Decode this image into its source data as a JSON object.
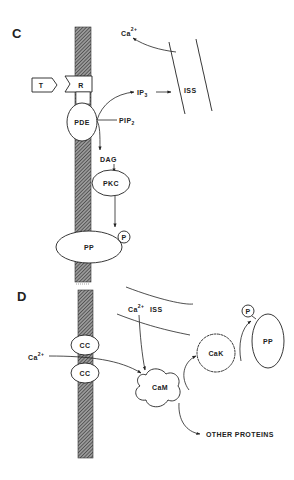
{
  "figure": {
    "panels": [
      {
        "id": "C",
        "label": "C",
        "nodes": {
          "T": "T",
          "R": "R",
          "PDE": "PDE",
          "PIP2": "PIP",
          "PIP2_sub": "2",
          "IP3": "IP",
          "IP3_sub": "3",
          "ISS": "ISS",
          "Ca": "Ca",
          "Ca_sup": "2+",
          "DAG": "DAG",
          "PKC": "PKC",
          "PP": "PP",
          "P": "P"
        },
        "edges": [
          {
            "from": "PIP2",
            "to": "IP3",
            "via": "PDE"
          },
          {
            "from": "PIP2",
            "to": "DAG",
            "via": "PDE"
          },
          {
            "from": "IP3",
            "to": "ISS"
          },
          {
            "from": "ISS",
            "to": "Ca2+"
          },
          {
            "from": "DAG",
            "to": "PKC"
          },
          {
            "from": "PKC",
            "to": "PP"
          }
        ]
      },
      {
        "id": "D",
        "label": "D",
        "nodes": {
          "CC1": "CC",
          "CC2": "CC",
          "Ca_ext": "Ca",
          "Ca_ext_sup": "2+",
          "Ca_iss": "Ca",
          "Ca_iss_sup": "2+",
          "ISS": "ISS",
          "CaM": "CaM",
          "CaK": "CaK",
          "PP": "PP",
          "P": "P",
          "other": "OTHER PROTEINS"
        },
        "edges": [
          {
            "from": "Ca2+ (extracellular)",
            "to": "CaM",
            "via": "CC"
          },
          {
            "from": "Ca2+ ISS",
            "to": "CaM"
          },
          {
            "from": "CaM",
            "to": "CaK"
          },
          {
            "from": "CaK",
            "to": "PP"
          },
          {
            "from": "CaM",
            "to": "OTHER PROTEINS"
          }
        ]
      }
    ]
  },
  "colors": {
    "line": "#222222",
    "background": "#ffffff",
    "membrane_hatch": "#555555"
  }
}
